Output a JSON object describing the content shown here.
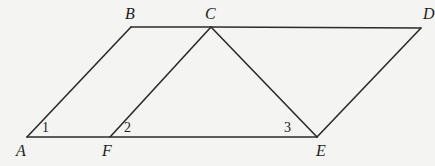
{
  "figure": {
    "background_color": "#f4f4f2",
    "stroke_color": "#2b2b2b",
    "label_color": "#1d1d1d",
    "stroke_width": 1.6,
    "width": 433,
    "height": 166
  },
  "vertices": [
    {
      "id": "A",
      "label": "A",
      "x": 27,
      "y": 137,
      "label_x": 16,
      "label_y": 143
    },
    {
      "id": "B",
      "label": "B",
      "x": 131,
      "y": 27,
      "label_x": 125,
      "label_y": 6
    },
    {
      "id": "C",
      "label": "C",
      "x": 211,
      "y": 27,
      "label_x": 205,
      "label_y": 6
    },
    {
      "id": "D",
      "label": "D",
      "x": 421,
      "y": 28,
      "label_x": 423,
      "label_y": 6
    },
    {
      "id": "E",
      "label": "E",
      "x": 317,
      "y": 137,
      "label_x": 316,
      "label_y": 143
    },
    {
      "id": "F",
      "label": "F",
      "x": 110,
      "y": 137,
      "label_x": 102,
      "label_y": 143
    }
  ],
  "segments": [
    {
      "name": "segment-A-B",
      "from": "A",
      "to": "B"
    },
    {
      "name": "segment-B-C",
      "from": "B",
      "to": "C"
    },
    {
      "name": "segment-C-D",
      "from": "C",
      "to": "D"
    },
    {
      "name": "segment-D-E",
      "from": "D",
      "to": "E"
    },
    {
      "name": "segment-E-A",
      "from": "E",
      "to": "A"
    },
    {
      "name": "segment-F-C",
      "from": "F",
      "to": "C"
    },
    {
      "name": "segment-C-E",
      "from": "C",
      "to": "E"
    }
  ],
  "angle_labels": [
    {
      "id": "1",
      "label": "1",
      "x": 42,
      "y": 121,
      "at_vertex": "A"
    },
    {
      "id": "2",
      "label": "2",
      "x": 124,
      "y": 121,
      "at_vertex": "F"
    },
    {
      "id": "3",
      "label": "3",
      "x": 284,
      "y": 121,
      "at_vertex": "E"
    }
  ],
  "watermark": {
    "text": ""
  }
}
